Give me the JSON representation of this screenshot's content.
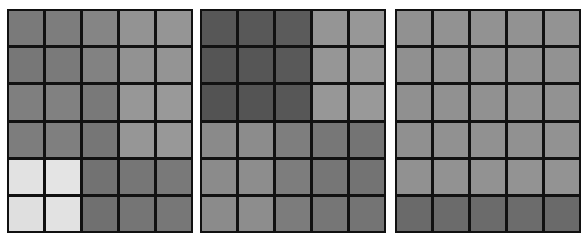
{
  "figure": {
    "panels": [
      {
        "id": "panel-1",
        "left": 7,
        "rows": 6,
        "cols": 5,
        "cells": [
          [
            "#7a7a7a",
            "#7d7d7d",
            "#858585",
            "#939393",
            "#959595"
          ],
          [
            "#777777",
            "#7a7a7a",
            "#828282",
            "#929292",
            "#949494"
          ],
          [
            "#7f7f7f",
            "#818181",
            "#797979",
            "#979797",
            "#999999"
          ],
          [
            "#7d7d7d",
            "#7f7f7f",
            "#767676",
            "#969696",
            "#989898"
          ],
          [
            "#e2e2e2",
            "#e4e4e4",
            "#727272",
            "#767676",
            "#797979"
          ],
          [
            "#dfdfdf",
            "#e2e2e2",
            "#707070",
            "#757575",
            "#777777"
          ]
        ]
      },
      {
        "id": "panel-2",
        "left": 200,
        "rows": 6,
        "cols": 5,
        "cells": [
          [
            "#575757",
            "#585858",
            "#5b5b5b",
            "#959595",
            "#979797"
          ],
          [
            "#555555",
            "#565656",
            "#595959",
            "#969696",
            "#989898"
          ],
          [
            "#535353",
            "#545454",
            "#575757",
            "#979797",
            "#999999"
          ],
          [
            "#8a8a8a",
            "#8c8c8c",
            "#7e7e7e",
            "#777777",
            "#747474"
          ],
          [
            "#8b8b8b",
            "#8d8d8d",
            "#7d7d7d",
            "#767676",
            "#737373"
          ],
          [
            "#8b8b8b",
            "#8d8d8d",
            "#7c7c7c",
            "#767676",
            "#747474"
          ]
        ]
      },
      {
        "id": "panel-3",
        "left": 395,
        "rows": 6,
        "cols": 5,
        "cells": [
          [
            "#919191",
            "#929292",
            "#929292",
            "#929292",
            "#939393"
          ],
          [
            "#909090",
            "#919191",
            "#929292",
            "#929292",
            "#929292"
          ],
          [
            "#909090",
            "#919191",
            "#919191",
            "#929292",
            "#929292"
          ],
          [
            "#909090",
            "#919191",
            "#919191",
            "#919191",
            "#929292"
          ],
          [
            "#919191",
            "#929292",
            "#929292",
            "#939393",
            "#939393"
          ],
          [
            "#6a6a6a",
            "#6b6b6b",
            "#6b6b6b",
            "#6c6c6c",
            "#6a6a6a"
          ]
        ]
      }
    ],
    "colors": {
      "background": "#ffffff",
      "grid_lines": "#111111"
    }
  }
}
